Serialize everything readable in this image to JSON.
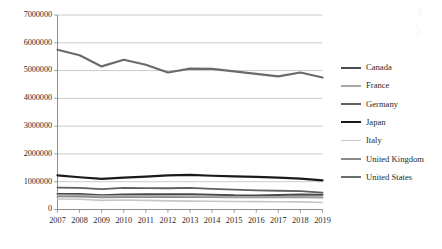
{
  "chart_data": {
    "type": "line",
    "title": "",
    "xlabel": "",
    "ylabel": "",
    "x": [
      2007,
      2008,
      2009,
      2010,
      2011,
      2012,
      2013,
      2014,
      2015,
      2016,
      2017,
      2018,
      2019
    ],
    "xtick_labels": [
      "2007",
      "2008",
      "2009",
      "2010",
      "2011",
      "2012",
      "2013",
      "2014",
      "2015",
      "2016",
      "2017",
      "2018",
      "2019"
    ],
    "ylim": [
      0,
      7000000
    ],
    "ytick_labels": [
      "0",
      "1000000",
      "2000000",
      "3000000",
      "4000000",
      "5000000",
      "6000000",
      "7000000"
    ],
    "ytick_values": [
      0,
      1000000,
      2000000,
      3000000,
      4000000,
      5000000,
      6000000,
      7000000
    ],
    "grid": true,
    "legend_position": "right",
    "series": [
      {
        "name": "Canada",
        "color": "#4a4a4a",
        "width": 2.0,
        "values": [
          560000,
          560000,
          510000,
          540000,
          545000,
          545000,
          545000,
          535000,
          510000,
          505000,
          520000,
          540000,
          530000
        ]
      },
      {
        "name": "France",
        "color": "#a8a8a8",
        "width": 1.6,
        "values": [
          520000,
          515000,
          480000,
          495000,
          490000,
          485000,
          480000,
          470000,
          455000,
          450000,
          455000,
          460000,
          450000
        ]
      },
      {
        "name": "Germany",
        "color": "#5f5f5f",
        "width": 1.8,
        "values": [
          790000,
          780000,
          730000,
          775000,
          770000,
          765000,
          775000,
          740000,
          715000,
          690000,
          675000,
          660000,
          610000
        ]
      },
      {
        "name": "Japan",
        "color": "#1a1a1a",
        "width": 2.2,
        "values": [
          1230000,
          1160000,
          1100000,
          1150000,
          1185000,
          1225000,
          1245000,
          1215000,
          1190000,
          1175000,
          1150000,
          1110000,
          1045000
        ]
      },
      {
        "name": "Italy",
        "color": "#c6c6c6",
        "width": 1.6,
        "values": [
          380000,
          370000,
          330000,
          340000,
          330000,
          310000,
          300000,
          295000,
          290000,
          285000,
          280000,
          275000,
          250000
        ]
      },
      {
        "name": "United Kingdom",
        "color": "#8a8a8a",
        "width": 1.8,
        "values": [
          470000,
          460000,
          440000,
          450000,
          445000,
          450000,
          450000,
          445000,
          440000,
          435000,
          440000,
          445000,
          430000
        ]
      },
      {
        "name": "United States",
        "color": "#6b6b6b",
        "width": 2.2,
        "values": [
          5750000,
          5550000,
          5150000,
          5390000,
          5210000,
          4930000,
          5070000,
          5060000,
          4970000,
          4880000,
          4790000,
          4930000,
          4750000
        ]
      }
    ]
  },
  "legend": {
    "items": [
      {
        "label": "Canada"
      },
      {
        "label": "France"
      },
      {
        "label": "Germany"
      },
      {
        "label": "Japan"
      },
      {
        "label": "Italy"
      },
      {
        "label": "United Kingdom"
      },
      {
        "label": "United States"
      }
    ]
  },
  "axes": {
    "axis_color": "#808080",
    "grid_color": "#b5b5b5",
    "tick_color": "#808080"
  }
}
